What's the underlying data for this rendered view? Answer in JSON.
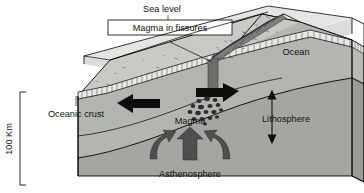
{
  "figure": {
    "type": "geological-block-diagram"
  },
  "labels": {
    "sea_level": "Sea level",
    "magma_in_fissures": "Magma in fissures",
    "ocean": "Ocean",
    "oceanic_crust": "Oceanic crust",
    "lithosphere": "Lithosphere",
    "magma": "Magma",
    "asthenosphere": "Asthenosphere",
    "depth_scale": "100 Km"
  },
  "colors": {
    "water": "#d9dbd8",
    "seafloor": "#c9cac6",
    "lithosphere": "#b4b5b1",
    "asthenosphere": "#a5a6a2",
    "lithosphere_side": "#b9bab6",
    "asthenosphere_side": "#9a9b97",
    "crust_band": "#e8e9e6",
    "arrow_black": "#0d0d0d",
    "arrow_convection": "#4e4e4e",
    "magma_blob": "#3c3c3c",
    "outline": "#000000",
    "text": "#111111",
    "background": "#ffffff"
  },
  "annotations": {
    "spreading_arrow_left": "spreading direction west",
    "spreading_arrow_right": "spreading direction east",
    "convection_arrows": [
      "upwelling left",
      "upwelling center",
      "upwelling right"
    ]
  }
}
